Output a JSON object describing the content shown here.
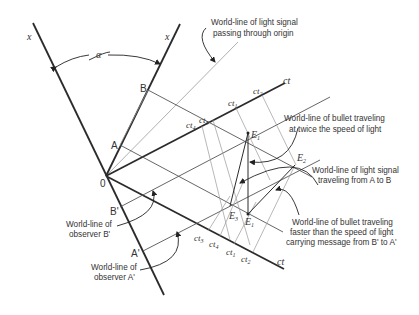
{
  "diagram": {
    "axes": {
      "x_left_label": "x",
      "x_right_label": "x",
      "angle_label": "α",
      "origin_label": "0",
      "ct_upper_label": "ct",
      "ct_lower_label": "ct"
    },
    "points": {
      "A": "A",
      "B": "B",
      "A_prime": "A'",
      "B_prime": "B'",
      "E1_upper": "E",
      "E1_upper_sub": "1",
      "E2": "E",
      "E2_sub": "2",
      "E3": "E",
      "E3_sub": "3",
      "E1_lower": "E",
      "E1_lower_sub": "1"
    },
    "upper_ticks": [
      {
        "main": "ct",
        "sub": "4"
      },
      {
        "main": "ct",
        "sub": "3"
      },
      {
        "main": "ct",
        "sub": "1"
      },
      {
        "main": "ct",
        "sub": "2"
      }
    ],
    "lower_ticks": [
      {
        "main": "ct",
        "sub": "3"
      },
      {
        "main": "ct",
        "sub": "4"
      },
      {
        "main": "ct",
        "sub": "1"
      },
      {
        "main": "ct",
        "sub": "2"
      }
    ],
    "annotations": {
      "light_origin_line1": "World-line of light signal",
      "light_origin_line2": "passing through origin",
      "bullet2c_line1": "World-line of bullet traveling",
      "bullet2c_line2": "at twice the speed of light",
      "lightAB_line1": "World-line of light signal",
      "lightAB_line2": "traveling from A to B",
      "bulletFTL_line1": "World-line of bullet traveling",
      "bulletFTL_line2": "faster than the speed of light",
      "bulletFTL_line3": "carrying message from B' to A'",
      "observerB_line1": "World-line of",
      "observerB_line2": "observer B'",
      "observerA_line1": "World-line of",
      "observerA_line2": "observer A'"
    },
    "colors": {
      "axis": "#2b2b2b",
      "thin_line": "#555555",
      "light_line": "#9a9a9a",
      "text": "#333333"
    }
  }
}
